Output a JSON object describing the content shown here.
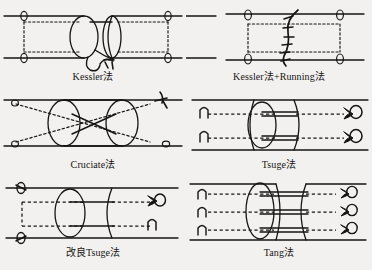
{
  "figure": {
    "background_color": "#f2f1ef",
    "ink_color": "#171514",
    "columns": 2,
    "rows": 3,
    "panel_width": 186,
    "panel_height": 90
  },
  "panels": [
    {
      "id": "kessler",
      "caption": "Kessler法",
      "technique": "Kessler",
      "core_sutures": 1,
      "knot_location": "outside-repair-site-volar",
      "suture_style": "dotted",
      "grasping_ends": 2,
      "description": "Single core suture with transverse grasping loops on each side and knot at the repair site"
    },
    {
      "id": "kessler-running",
      "caption": "Kessler法+Running法",
      "technique": "Kessler + Running",
      "core_sutures": 1,
      "knot_location": "repair-site",
      "suture_style": "dotted",
      "epitendinous": "running",
      "running_stitch_count": 6,
      "description": "Kessler core suture reinforced with a running epitendinous stitch across the repair line"
    },
    {
      "id": "cruciate",
      "caption": "Cruciate法",
      "technique": "Cruciate",
      "core_sutures": 2,
      "knot_location": "outside",
      "suture_style": "dotted",
      "crossings": 1,
      "description": "Two crossing core sutures forming an X across the repair site"
    },
    {
      "id": "tsuge",
      "caption": "Tsuge法",
      "technique": "Tsuge",
      "core_sutures": 2,
      "knot_location": "both-ends",
      "suture_style": "dashed",
      "loops": 2,
      "description": "Two looped suture strands running longitudinally with anchor loops at each end"
    },
    {
      "id": "modified-tsuge",
      "caption": "改良Tsuge法",
      "technique": "Modified Tsuge",
      "core_sutures": 2,
      "knot_location": "both-ends",
      "suture_style": "dashed",
      "loops": 2,
      "description": "Modified Tsuge repair with paired looped strands anchored outside the repair site"
    },
    {
      "id": "tang",
      "caption": "Tang法",
      "technique": "Tang",
      "core_sutures": 3,
      "knot_location": "both-ends",
      "suture_style": "dashed",
      "loops": 3,
      "description": "Three looped suture strands giving a six-strand core repair"
    }
  ],
  "legend": {
    "tendon_outline": "solid line",
    "suture_path": "dotted line",
    "cut_ends": "ellipse",
    "knot": "loop glyph"
  }
}
